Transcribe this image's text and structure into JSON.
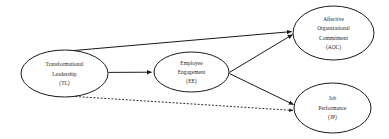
{
  "diagram": {
    "background_color": "#ffffff",
    "line_color": "#1a1a1a",
    "text_color": "#1d1d1d",
    "nodes": [
      {
        "id": "tl",
        "name": "transformational-leadership",
        "lines": [
          "Transformational",
          "Leadership",
          "(TL)"
        ],
        "line1": "Transformational",
        "line2": "Leadership",
        "line3": "(TL)",
        "cx": 64.5,
        "cy": 73.5,
        "rx": 43.5,
        "ry": 23.5
      },
      {
        "id": "ee",
        "name": "employee-engagement",
        "lines": [
          "Employee",
          "Engagement",
          "(EE)"
        ],
        "line1": "Employee",
        "line2": "Engagement",
        "line3": "(EE)",
        "cx": 191.5,
        "cy": 72,
        "rx": 37.5,
        "ry": 20
      },
      {
        "id": "aoc",
        "name": "affective-organizational-commitment",
        "lines": [
          "Affective",
          "Organizational",
          "Commitment",
          "(AOC)"
        ],
        "line1": "Affective",
        "line2": "Organizational",
        "line3": "Commitment",
        "line4": "(AOC)",
        "cx": 333.5,
        "cy": 33,
        "rx": 40.5,
        "ry": 27
      },
      {
        "id": "jp",
        "name": "job-performance",
        "lines": [
          "Job",
          "Performance",
          "(JP)"
        ],
        "line1": "Job",
        "line2": "Performance",
        "line3": "(JP)",
        "cx": 332.5,
        "cy": 108,
        "rx": 38.5,
        "ry": 25
      }
    ],
    "edges": [
      {
        "id": "tl-aoc",
        "name": "edge-tl-to-aoc",
        "from": "tl",
        "to": "aoc",
        "style": "solid",
        "arrow": true
      },
      {
        "id": "tl-ee",
        "name": "edge-tl-to-ee",
        "from": "tl",
        "to": "ee",
        "style": "solid",
        "arrow": true
      },
      {
        "id": "ee-aoc",
        "name": "edge-ee-to-aoc",
        "from": "ee",
        "to": "aoc",
        "style": "solid",
        "arrow": true
      },
      {
        "id": "ee-jp",
        "name": "edge-ee-to-jp",
        "from": "ee",
        "to": "jp",
        "style": "solid",
        "arrow": true
      },
      {
        "id": "tl-jp",
        "name": "edge-tl-to-jp",
        "from": "tl",
        "to": "jp",
        "style": "dashed",
        "arrow": true
      }
    ]
  }
}
